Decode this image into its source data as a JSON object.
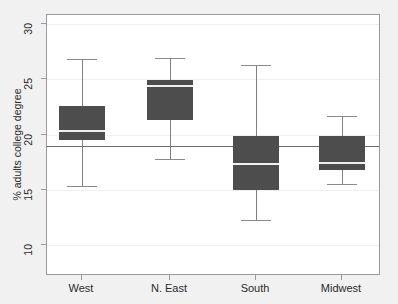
{
  "chart_data": {
    "type": "box",
    "title": "",
    "xlabel": "",
    "ylabel": "% adults college degree",
    "categories": [
      "West",
      "N. East",
      "South",
      "Midwest"
    ],
    "ylim": [
      10,
      30
    ],
    "yticks": [
      10,
      15,
      20,
      25,
      30
    ],
    "ytick_labels": [
      "10",
      "15",
      "20",
      "25",
      "30"
    ],
    "grid": true,
    "legend": "none",
    "reference_line": {
      "value": 19,
      "orientation": "horizontal",
      "label": ""
    },
    "boxes": [
      {
        "category": "West",
        "whisker_low": 15.3,
        "q1": 19.5,
        "median": 20.3,
        "q3": 22.6,
        "whisker_high": 26.8
      },
      {
        "category": "N. East",
        "whisker_low": 17.8,
        "q1": 21.3,
        "median": 24.4,
        "q3": 24.9,
        "whisker_high": 26.9
      },
      {
        "category": "South",
        "whisker_low": 12.3,
        "q1": 15.0,
        "median": 17.3,
        "q3": 19.9,
        "whisker_high": 26.3
      },
      {
        "category": "Midwest",
        "whisker_low": 15.5,
        "q1": 16.8,
        "median": 17.4,
        "q3": 19.9,
        "whisker_high": 21.7
      }
    ],
    "colors": {
      "box_fill": "#4d4d4d",
      "median_line": "#f0f0f0",
      "whisker": "#808080",
      "reference_line": "#6d6d6d",
      "plot_background": "#ffffff",
      "figure_background": "#f1f1f1",
      "gridline": "#efefef",
      "axis": "#9a9a9a",
      "text": "#2b2b2b"
    }
  }
}
